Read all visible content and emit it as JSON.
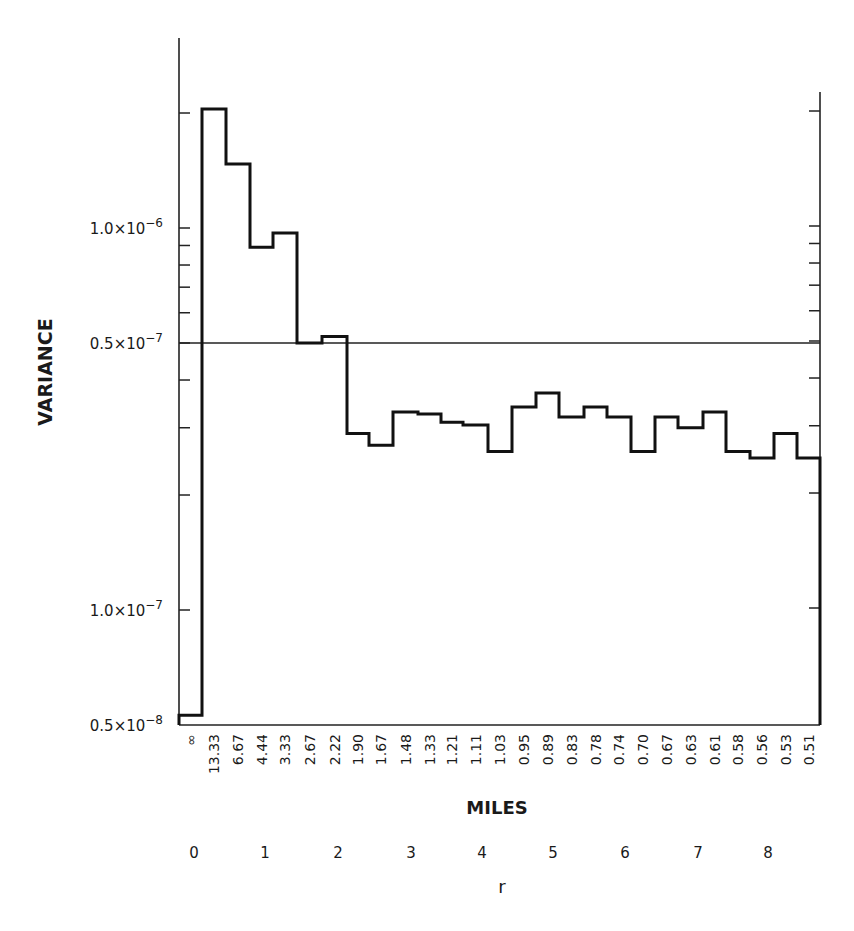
{
  "chart_data": {
    "type": "bar",
    "style": "step-histogram",
    "title": "",
    "ylabel": "VARIANCE",
    "xlabel": "MILES",
    "x2label": "r",
    "yscale": "log",
    "ylim": [
      5e-08,
      2.5e-06
    ],
    "grid": false,
    "legend": null,
    "y_tick_labels": [
      {
        "label": "1.0×10",
        "exp": "-6",
        "value": 1e-06
      },
      {
        "label": "0.5×10",
        "exp": "-7",
        "value": 5e-07
      },
      {
        "label": "1.0×10",
        "exp": "-7",
        "value": 1e-07
      },
      {
        "label": "0.5×10",
        "exp": "-8",
        "value": 5e-08
      }
    ],
    "reference_line": {
      "value": 5e-07,
      "label": "0.5×10⁻⁷"
    },
    "categories": [
      "∞",
      "13.33",
      "6.67",
      "4.44",
      "3.33",
      "2.67",
      "2.22",
      "1.90",
      "1.67",
      "1.48",
      "1.33",
      "1.21",
      "1.11",
      "1.03",
      "0.95",
      "0.89",
      "0.83",
      "0.78",
      "0.74",
      "0.70",
      "0.67",
      "0.63",
      "0.61",
      "0.58",
      "0.56",
      "0.53",
      "0.51"
    ],
    "values": [
      5.3e-08,
      2.05e-06,
      1.47e-06,
      8.9e-07,
      9.7e-07,
      5e-07,
      5.2e-07,
      2.9e-07,
      2.7e-07,
      3.3e-07,
      3.26e-07,
      3.1e-07,
      3.05e-07,
      2.6e-07,
      3.4e-07,
      3.7e-07,
      3.2e-07,
      3.4e-07,
      3.2e-07,
      2.6e-07,
      3.2e-07,
      3e-07,
      3.3e-07,
      2.6e-07,
      2.5e-07,
      2.9e-07,
      2.5e-07
    ],
    "r_tick_labels": [
      "0",
      "1",
      "2",
      "3",
      "4",
      "5",
      "6",
      "7",
      "8"
    ]
  }
}
